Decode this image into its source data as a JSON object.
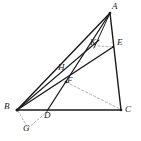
{
  "figure": {
    "width": 141,
    "height": 141,
    "background_color": "#ffffff",
    "stroke_color": "#1a1a1a",
    "dashed_color": "#8c8c8c",
    "label_color": "#1a1a1a"
  },
  "points": [
    {
      "id": "A",
      "label": "A",
      "x": 110,
      "y": 13,
      "label_x": 112,
      "label_y": 3,
      "role": "apex-vertex"
    },
    {
      "id": "B",
      "label": "B",
      "x": 17,
      "y": 110,
      "label_x": 5,
      "label_y": 103,
      "role": "base-left-vertex"
    },
    {
      "id": "C",
      "label": "C",
      "x": 121,
      "y": 110,
      "label_x": 124,
      "label_y": 106,
      "role": "base-right-vertex"
    },
    {
      "id": "E",
      "label": "E",
      "x": 113,
      "y": 47,
      "label_x": 117,
      "label_y": 39,
      "role": "point-on-segment-ac"
    },
    {
      "id": "K",
      "label": "K",
      "x": 96,
      "y": 46,
      "label_x": 91,
      "label_y": 39,
      "role": "interior-point"
    },
    {
      "id": "H",
      "label": "H",
      "x": 65,
      "y": 74,
      "label_x": 59,
      "label_y": 64,
      "role": "interior-point"
    },
    {
      "id": "F",
      "label": "F",
      "x": 65,
      "y": 82,
      "label_x": 67,
      "label_y": 77,
      "role": "interior-intersection"
    },
    {
      "id": "D",
      "label": "D",
      "x": 47,
      "y": 111,
      "label_x": 44,
      "label_y": 111,
      "role": "point-on-segment-bc"
    },
    {
      "id": "G",
      "label": "G",
      "x": 28,
      "y": 129,
      "label_x": 24,
      "label_y": 124,
      "role": "exterior-point"
    }
  ],
  "segments": [
    {
      "id": "AB",
      "from": "A",
      "to": "B",
      "style": "solid",
      "width": 1.3
    },
    {
      "id": "BC",
      "from": "B",
      "to": "C",
      "style": "solid",
      "width": 1.3
    },
    {
      "id": "AC",
      "from": "A",
      "to": "C",
      "style": "solid",
      "width": 1.3
    },
    {
      "id": "BE",
      "from": "B",
      "to": "E",
      "style": "solid",
      "width": 1.3
    },
    {
      "id": "AD",
      "from": "A",
      "to": "D",
      "style": "solid",
      "width": 1.3
    },
    {
      "id": "BH_G",
      "from": "B",
      "to": "H",
      "style": "solid",
      "width": 1.0
    },
    {
      "id": "AF",
      "from": "A",
      "to": "F",
      "style": "solid",
      "width": 1.0
    },
    {
      "id": "FC",
      "from": "F",
      "to": "C",
      "style": "dashed",
      "width": 0.8
    },
    {
      "id": "KE",
      "from": "K",
      "to": "E",
      "style": "dashed",
      "width": 0.8
    },
    {
      "id": "BG",
      "from": "B",
      "to": "G",
      "style": "dashed",
      "width": 0.8
    },
    {
      "id": "GD",
      "from": "G",
      "to": "D",
      "style": "dashed",
      "width": 0.8
    },
    {
      "id": "AK",
      "from": "A",
      "to": "K",
      "style": "solid",
      "width": 1.0
    }
  ]
}
